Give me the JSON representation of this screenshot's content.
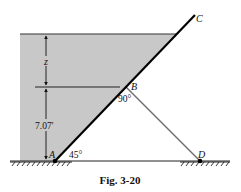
{
  "figure": {
    "caption": "Fig. 3-20",
    "points": {
      "A": "A",
      "B": "B",
      "C": "C",
      "D": "D"
    },
    "dimensions": {
      "upper": "z",
      "lower": "7.07'"
    },
    "angles": {
      "at_A": "45°",
      "at_B": "90°"
    },
    "colors": {
      "water": "#c8c8c8",
      "gate": "#000000",
      "strut": "#6e6e6e",
      "ink": "#111111"
    }
  }
}
